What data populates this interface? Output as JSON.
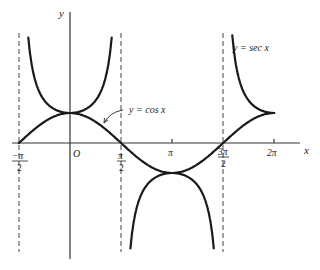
{
  "figure": {
    "axis_labels": {
      "x": "x",
      "y": "y",
      "origin": "O"
    },
    "curve_labels": {
      "cos": "y = cos x",
      "sec": "y = sec x"
    },
    "tick_labels": {
      "neg_pi_over_2_num": "−π",
      "neg_pi_over_2_den": "2",
      "pi_over_2_num": "π",
      "pi_over_2_den": "2",
      "pi": "π",
      "three_pi_over_2_num": "3π",
      "three_pi_over_2_den": "2",
      "two_pi": "2π"
    },
    "colors": {
      "curve": "#1a1a1a",
      "axis": "#333333",
      "asymptote": "#444444"
    }
  },
  "chart_data": {
    "type": "line",
    "xlabel": "x",
    "ylabel": "y",
    "x_ticks": [
      "-π/2",
      "π/2",
      "π",
      "3π/2",
      "2π"
    ],
    "xlim": [
      -1.6,
      7.4
    ],
    "ylim": [
      -3.9,
      4.4
    ],
    "asymptotes": [
      "x = -π/2",
      "x = π/2",
      "x = 3π/2"
    ],
    "series": [
      {
        "name": "y = cos x",
        "function": "cos(x)",
        "domain": [
          -1.5708,
          6.2832
        ]
      },
      {
        "name": "y = sec x",
        "function": "1/cos(x)",
        "domain": [
          -1.5708,
          6.2832
        ]
      }
    ],
    "grid": false,
    "legend": "inline labels"
  }
}
